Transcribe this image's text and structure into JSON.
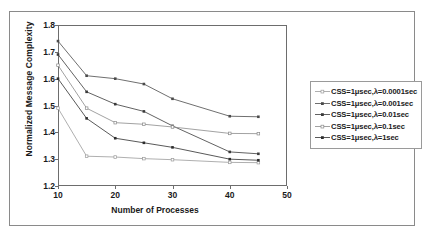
{
  "chart_data": {
    "type": "line",
    "title": "",
    "xlabel": "Number of Processes",
    "ylabel": "Normalized Message Complexity",
    "xlim": [
      10,
      50
    ],
    "ylim": [
      1.2,
      1.8
    ],
    "xticks": [
      10,
      20,
      30,
      40,
      50
    ],
    "yticks": [
      "1.2",
      "1.3",
      "1.4",
      "1.5",
      "1.6",
      "1.7",
      "1.8"
    ],
    "grid": false,
    "legend_position": "right",
    "x": [
      10,
      15,
      20,
      25,
      30,
      40,
      45
    ],
    "series": [
      {
        "name": "CSS=1μsec,λ=0.0001sec",
        "marker": "open-square",
        "color": "#9a9a9a",
        "values": [
          1.49,
          1.311,
          1.308,
          1.302,
          1.298,
          1.288,
          1.287
        ]
      },
      {
        "name": "CSS=1μsec,λ=0.001sec",
        "marker": "filled-square",
        "color": "#4a4a4a",
        "values": [
          1.74,
          1.611,
          1.6,
          1.58,
          1.525,
          1.46,
          1.458
        ]
      },
      {
        "name": "CSS=1μsec,λ=0.01sec",
        "marker": "filled-square",
        "color": "#3a3a3a",
        "values": [
          1.69,
          1.551,
          1.505,
          1.478,
          1.424,
          1.327,
          1.32
        ]
      },
      {
        "name": "CSS=1μsec,λ=0.1sec",
        "marker": "open-square",
        "color": "#8a8a8a",
        "values": [
          1.65,
          1.49,
          1.436,
          1.43,
          1.42,
          1.396,
          1.395
        ]
      },
      {
        "name": "CSS=1μsec,λ=1sec",
        "marker": "filled-square",
        "color": "#2e2e2e",
        "values": [
          1.6,
          1.452,
          1.378,
          1.361,
          1.344,
          1.3,
          1.296
        ]
      }
    ]
  }
}
